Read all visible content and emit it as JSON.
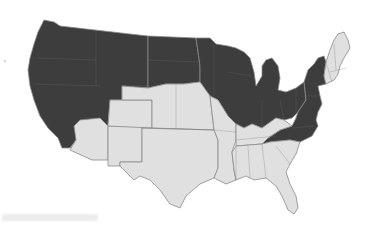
{
  "map": {
    "type": "choropleth",
    "region": "United States (contiguous)",
    "legend": null,
    "colors": {
      "highlighted": "#3d3d3d",
      "other": "#e0e0e0",
      "border": "#8a8a8a",
      "background": "#ffffff"
    },
    "highlighted_states": [
      "WA",
      "OR",
      "CA",
      "NV",
      "ID",
      "MT",
      "WY",
      "UT",
      "ND",
      "SD",
      "MN",
      "WI",
      "IA",
      "IL",
      "MI",
      "IN",
      "OH",
      "PA",
      "NY",
      "NJ",
      "DE",
      "MD",
      "WV",
      "VA",
      "NC"
    ],
    "other_states": [
      "AZ",
      "NM",
      "CO",
      "NE",
      "KS",
      "OK",
      "TX",
      "MO",
      "AR",
      "LA",
      "MS",
      "AL",
      "GA",
      "FL",
      "SC",
      "TN",
      "KY",
      "ME",
      "NH",
      "VT",
      "MA",
      "CT",
      "RI"
    ]
  },
  "caption": {
    "text": ""
  }
}
